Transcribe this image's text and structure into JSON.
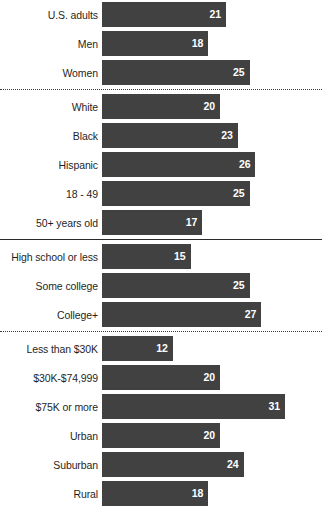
{
  "chart_data": {
    "type": "bar",
    "title": "",
    "subtitle": "",
    "xlabel": "",
    "ylabel": "",
    "orientation": "horizontal",
    "grid": false,
    "legend": null,
    "xlim": [
      0,
      35
    ],
    "value_suffix": "",
    "bar_color": "#414141",
    "value_label_color": "#ffffff",
    "categories": [
      "U.S. adults",
      "Men",
      "Women",
      "White",
      "Black",
      "Hispanic",
      "18 - 49",
      "50+ years old",
      "High school or less",
      "Some college",
      "College+",
      "Less than $30K",
      "$30K-$74,999",
      "$75K or more",
      "Urban",
      "Suburban",
      "Rural"
    ],
    "values": [
      21,
      18,
      25,
      20,
      23,
      26,
      25,
      17,
      15,
      25,
      27,
      12,
      20,
      31,
      20,
      24,
      18
    ],
    "groups": [
      {
        "name": "total-and-gender",
        "separator_after": "dotted",
        "rows": [
          {
            "label": "U.S. adults",
            "value": 21
          },
          {
            "label": "Men",
            "value": 18
          },
          {
            "label": "Women",
            "value": 25
          }
        ]
      },
      {
        "name": "race-and-age",
        "separator_after": "solid",
        "rows": [
          {
            "label": "White",
            "value": 20
          },
          {
            "label": "Black",
            "value": 23
          },
          {
            "label": "Hispanic",
            "value": 26
          },
          {
            "label": "18 - 49",
            "value": 25
          },
          {
            "label": "50+ years old",
            "value": 17
          }
        ]
      },
      {
        "name": "education",
        "separator_after": "dotted",
        "rows": [
          {
            "label": "High school or less",
            "value": 15
          },
          {
            "label": "Some college",
            "value": 25
          },
          {
            "label": "College+",
            "value": 27
          }
        ]
      },
      {
        "name": "income-and-community",
        "separator_after": "none",
        "rows": [
          {
            "label": "Less than $30K",
            "value": 12
          },
          {
            "label": "$30K-$74,999",
            "value": 20
          },
          {
            "label": "$75K or more",
            "value": 31
          },
          {
            "label": "Urban",
            "value": 20
          },
          {
            "label": "Suburban",
            "value": 24
          },
          {
            "label": "Rural",
            "value": 18
          }
        ]
      }
    ]
  }
}
